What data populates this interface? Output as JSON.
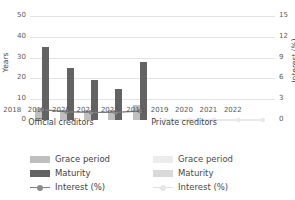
{
  "chart_data": {
    "type": "bar",
    "title": "",
    "xlabel": "",
    "ylabel": "Years",
    "y2label": "Interest (%)",
    "ylim": [
      0,
      50
    ],
    "y2lim": [
      0,
      15
    ],
    "grid": true,
    "legend_position": "bottom",
    "categories": [
      "2018",
      "2019",
      "2020",
      "2021",
      "2022"
    ],
    "panels": [
      {
        "name": "Official creditors",
        "series": [
          {
            "name": "Grace period",
            "axis": "left",
            "values": [
              6,
              5,
              5,
              5,
              7
            ]
          },
          {
            "name": "Maturity",
            "axis": "left",
            "values": [
              35,
              25,
              19,
              15,
              28
            ]
          },
          {
            "name": "Interest (%)",
            "axis": "right",
            "values": [
              1.5,
              1.2,
              1.1,
              1.1,
              1.3
            ]
          }
        ]
      },
      {
        "name": "Private creditors",
        "series": [
          {
            "name": "Grace period",
            "axis": "left",
            "values": [
              0,
              0,
              0,
              0,
              0
            ]
          },
          {
            "name": "Maturity",
            "axis": "left",
            "values": [
              0,
              0,
              0,
              0,
              0
            ]
          },
          {
            "name": "Interest (%)",
            "axis": "right",
            "values": [
              0,
              0,
              0,
              0,
              0
            ]
          }
        ]
      }
    ],
    "yticks_left": [
      "0",
      "10",
      "20",
      "30",
      "40",
      "50"
    ],
    "yticks_right": [
      "0",
      "3",
      "6",
      "9",
      "12",
      "15"
    ]
  },
  "axes": {
    "left_title": "Years",
    "right_title": "Interest (%)",
    "left_ticks": [
      "50",
      "40",
      "30",
      "20",
      "10",
      "0"
    ],
    "right_ticks": [
      "15",
      "12",
      "9",
      "6",
      "3",
      "0"
    ]
  },
  "panels": {
    "official": {
      "caption": "Official creditors",
      "xticks": [
        "2018",
        "2019",
        "2020",
        "2021",
        "2022"
      ]
    },
    "private": {
      "caption": "Private creditors",
      "xticks": [
        "2018",
        "2019",
        "2020",
        "2021",
        "2022"
      ]
    }
  },
  "legend": {
    "official": {
      "grace": "Grace period",
      "maturity": "Maturity",
      "interest": "Interest (%)"
    },
    "private": {
      "grace": "Grace period",
      "maturity": "Maturity",
      "interest": "Interest (%)"
    }
  },
  "colors": {
    "grace": "#bfbfbf",
    "maturity": "#636363",
    "interest": "#808080",
    "grace_faded": "#ececec",
    "maturity_faded": "#d9d9d9",
    "grid": "#e3e3e3",
    "text": "#3f3f3f"
  }
}
